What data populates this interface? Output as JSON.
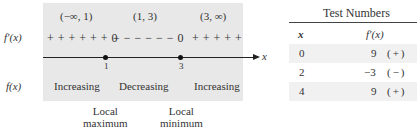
{
  "sign_chart": {
    "intervals": [
      "(−∞, 1)",
      "(1, 3)",
      "(3, ∞)"
    ],
    "row_labels": {
      "derivative": "f′(x)",
      "function": "f(x)"
    },
    "sign_strings": {
      "segment1": "+ + + + + + 0",
      "segment2": "− − − − − − 0",
      "segment3": "+ + + + +"
    },
    "axis_label": "x",
    "critical_points": [
      "1",
      "3"
    ],
    "behavior": [
      "Increasing",
      "Decreasing",
      "Increasing"
    ],
    "annotations": [
      {
        "line1": "Local",
        "line2": "maximum"
      },
      {
        "line1": "Local",
        "line2": "minimum"
      }
    ],
    "colors": {
      "shade": "#e8e8e8",
      "axis": "#222222"
    }
  },
  "test_table": {
    "title": "Test Numbers",
    "headers": [
      "x",
      "f′(x)"
    ],
    "rows": [
      {
        "x": "0",
        "value": "9",
        "sign": "(+)"
      },
      {
        "x": "2",
        "value": "−3",
        "sign": "(−)"
      },
      {
        "x": "4",
        "value": "9",
        "sign": "(+)"
      }
    ]
  }
}
